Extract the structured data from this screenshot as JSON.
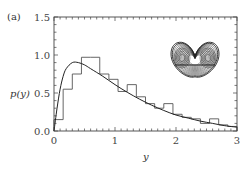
{
  "panel_label": "(a)",
  "chart_data": {
    "type": "bar",
    "title": "",
    "panel": "(a)",
    "xlabel": "y",
    "ylabel": "p(y)",
    "xlim": [
      0,
      3
    ],
    "ylim": [
      0,
      1.5
    ],
    "x_ticks": [
      "0",
      "1",
      "2",
      "3"
    ],
    "y_ticks": [
      "0.0",
      "0.5",
      "1.0",
      "1.5"
    ],
    "grid": false,
    "legend": null,
    "series": [
      {
        "name": "histogram",
        "kind": "step-histogram",
        "bin_width": 0.15,
        "bin_edges": [
          0,
          0.15,
          0.3,
          0.45,
          0.6,
          0.75,
          0.9,
          1.05,
          1.2,
          1.35,
          1.5,
          1.65,
          1.8,
          1.95,
          2.1,
          2.25,
          2.4,
          2.55,
          2.7,
          2.85,
          3.0
        ],
        "values": [
          0.15,
          0.55,
          0.75,
          0.97,
          0.97,
          0.75,
          0.68,
          0.52,
          0.61,
          0.45,
          0.36,
          0.3,
          0.36,
          0.22,
          0.18,
          0.16,
          0.1,
          0.16,
          0.08,
          0.06
        ]
      },
      {
        "name": "theoretical density",
        "kind": "line",
        "x": [
          0,
          0.05,
          0.1,
          0.15,
          0.2,
          0.3,
          0.4,
          0.5,
          0.6,
          0.8,
          1.0,
          1.2,
          1.4,
          1.6,
          1.8,
          2.0,
          2.2,
          2.4,
          2.6,
          2.8,
          3.0
        ],
        "values": [
          0.0,
          0.3,
          0.55,
          0.72,
          0.82,
          0.9,
          0.9,
          0.87,
          0.82,
          0.72,
          0.61,
          0.51,
          0.42,
          0.34,
          0.27,
          0.21,
          0.17,
          0.13,
          0.1,
          0.07,
          0.05
        ]
      }
    ],
    "annotations": [
      "inset: double-scroll chaotic attractor phase portrait (upper right)"
    ]
  }
}
